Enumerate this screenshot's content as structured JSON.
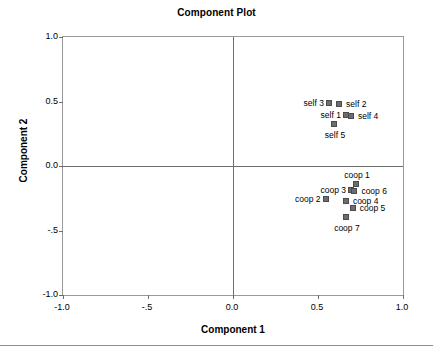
{
  "chart_data": {
    "type": "scatter",
    "title": "Component Plot",
    "xlabel": "Component 1",
    "ylabel": "Component 2",
    "xlim": [
      -1.0,
      1.0
    ],
    "ylim": [
      -1.0,
      1.0
    ],
    "xticks": [
      -1.0,
      -0.5,
      0.0,
      0.5,
      1.0
    ],
    "xtick_labels": [
      "-1.0",
      "-.5",
      "0.0",
      "0.5",
      "1.0"
    ],
    "yticks": [
      -1.0,
      -0.5,
      0.0,
      0.5,
      1.0
    ],
    "ytick_labels": [
      "-1.0",
      "-.5",
      "0.0",
      "0.5",
      "1.0"
    ],
    "grid": false,
    "legend": "none",
    "zero_lines": true,
    "marker_color": "#6d6d6d",
    "marker_edge_color": "#4c4c4c",
    "frame_color": "#9a9a9a",
    "points": [
      {
        "label": "self 3",
        "x": 0.57,
        "y": 0.48,
        "label_pos": "left"
      },
      {
        "label": "self 2",
        "x": 0.63,
        "y": 0.47,
        "label_pos": "right"
      },
      {
        "label": "self 1",
        "x": 0.67,
        "y": 0.39,
        "label_pos": "left"
      },
      {
        "label": "self 4",
        "x": 0.7,
        "y": 0.38,
        "label_pos": "right"
      },
      {
        "label": "self 5",
        "x": 0.6,
        "y": 0.32,
        "label_pos": "below"
      },
      {
        "label": "coop 1",
        "x": 0.73,
        "y": -0.15,
        "label_pos": "above"
      },
      {
        "label": "coop 3",
        "x": 0.7,
        "y": -0.19,
        "label_pos": "left"
      },
      {
        "label": "coop 6",
        "x": 0.72,
        "y": -0.2,
        "label_pos": "right"
      },
      {
        "label": "coop 2",
        "x": 0.55,
        "y": -0.26,
        "label_pos": "left"
      },
      {
        "label": "coop 4",
        "x": 0.67,
        "y": -0.28,
        "label_pos": "right"
      },
      {
        "label": "coop 5",
        "x": 0.71,
        "y": -0.33,
        "label_pos": "right"
      },
      {
        "label": "coop 7",
        "x": 0.67,
        "y": -0.4,
        "label_pos": "below"
      }
    ]
  }
}
